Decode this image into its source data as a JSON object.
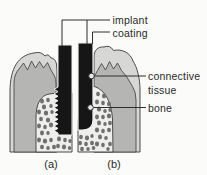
{
  "figure": {
    "type": "diagram",
    "labels": {
      "implant": "implant",
      "coating": "coating",
      "connective_tissue": [
        "connective",
        "tissue"
      ],
      "bone": "bone",
      "panel_a": "(a)",
      "panel_b": "(b)"
    },
    "colors": {
      "background": "#fbfbf9",
      "implant_black": "#161616",
      "implant_halo": "#efefef",
      "outer_tissue": "#d7d7d5",
      "inner_tissue": "#b5b5b3",
      "bone_fill": "#eeeeec",
      "bone_dot": "#6f6f6f",
      "outline": "#4b4b4b",
      "leader": "#2f2f2f",
      "marker_fill": "#e9e9e7",
      "label_text": "#2a2a2a"
    }
  }
}
